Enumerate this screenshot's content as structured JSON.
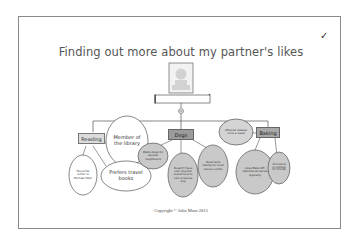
{
  "page": {
    "title": "Finding out more about my partner's likes",
    "check_mark": "✓",
    "copyright": "Copyright © Julia Moor 2013"
  },
  "colors": {
    "frame": "#8a8a8a",
    "title_text": "#555555",
    "category_box_light": "#dcdcdc",
    "category_box_dark": "#9a9a9a",
    "oval_white": "#ffffff",
    "oval_gray": "#c9c9c9",
    "lines": "#555555"
  },
  "diagram": {
    "center": {
      "photo_icon": "person-silhouette-icon",
      "name_box": "",
      "connector_icon": "add-circle-icon"
    },
    "categories": [
      {
        "label": "Reading",
        "children": [
          "Member of the library",
          "Favourite writer is Michael Palin",
          "Prefers travel books"
        ]
      },
      {
        "label": "Dogs",
        "children": [
          "Walks dogs for several neighbours",
          "Doesn't have own dog but would love to own a rescue dog",
          "Does fund raising for local rescue centre"
        ]
      },
      {
        "label": "Baking",
        "children": [
          "Attends classes once a week",
          "Likes Bake Off, watches all series regularly",
          "Interested in cooking for friends"
        ]
      }
    ]
  }
}
